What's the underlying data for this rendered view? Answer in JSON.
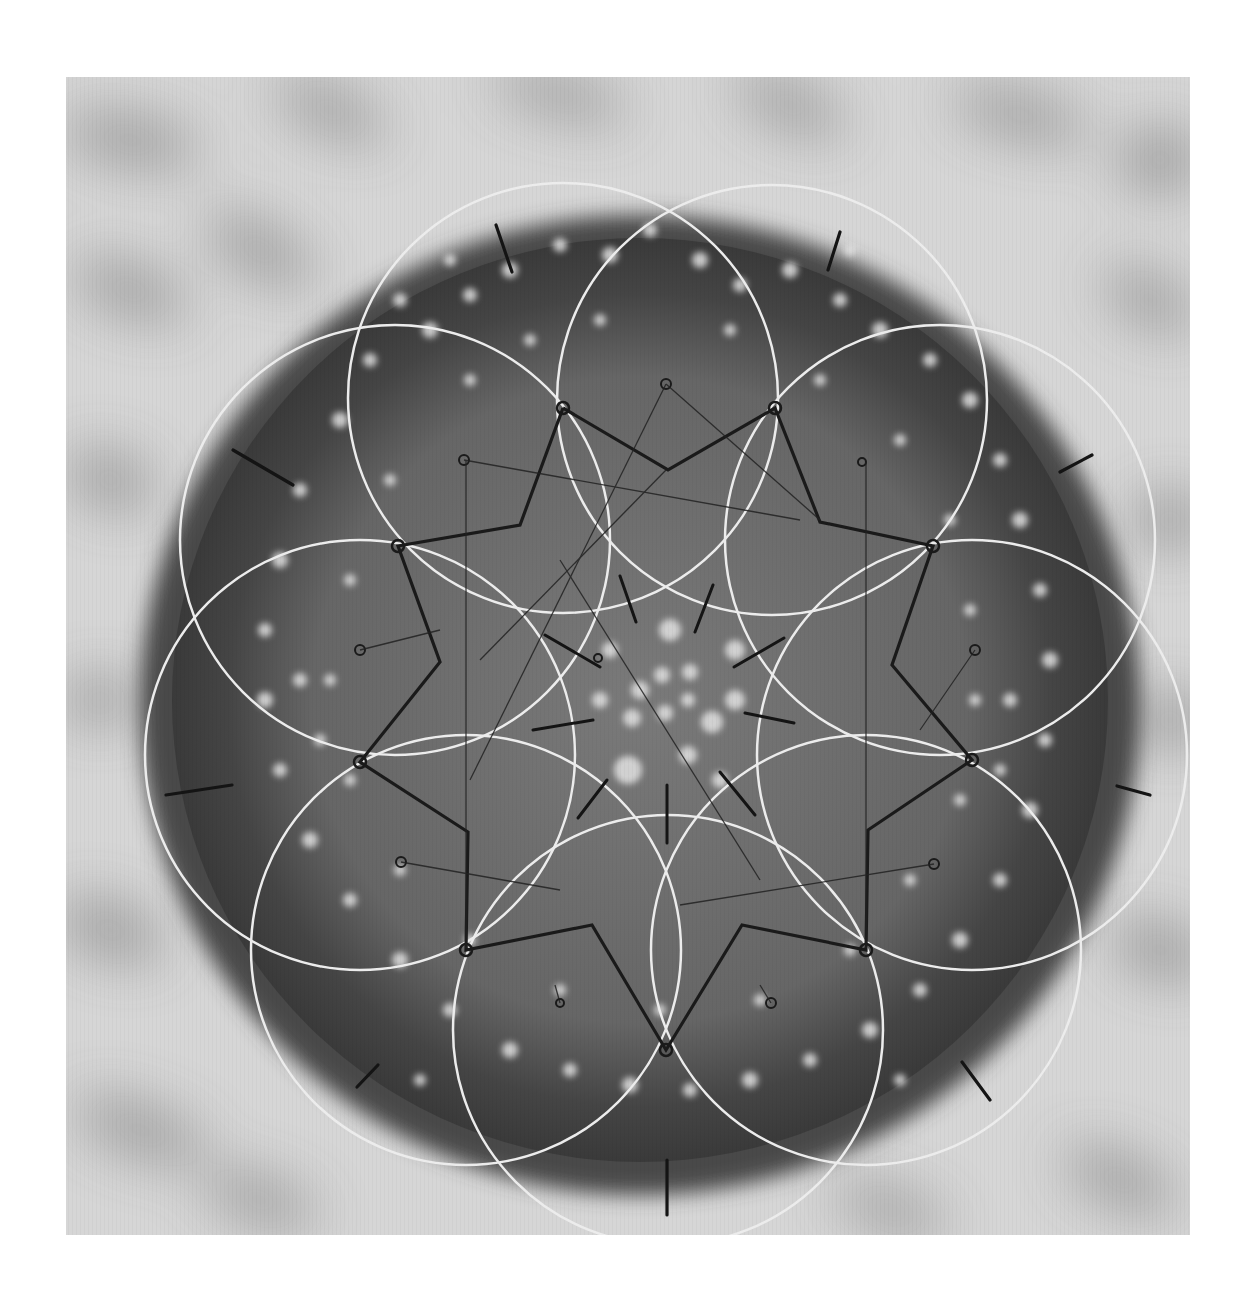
{
  "image": {
    "subject": "Top-down monochrome photograph of a globular cactus overlaid with hand-drawn sacred-geometry construction",
    "alt_text": "Cactus viewed from above with eight overlapping white circles, an eight-pointed star, tick marks and construction lines drawn over it",
    "palette": {
      "paper": "#ffffff",
      "background_light": "#d9d9d9",
      "background_shadow": "#8a8a8a",
      "cactus_body": "#6e6e6e",
      "cactus_rim": "#3f3f3f",
      "areole": "#e6e6e6",
      "circle_stroke": "#ececec",
      "ink": "#1a1a1a"
    }
  },
  "geometry": {
    "center": [
      667,
      700
    ],
    "circle_count": 8,
    "circle_radius": 215,
    "circle_center_distance": 320,
    "star_points": 8,
    "tick_marks_outer": 8,
    "tick_marks_inner": 8
  }
}
